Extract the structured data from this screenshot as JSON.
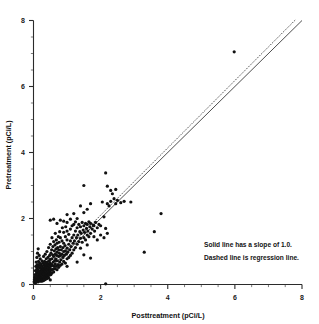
{
  "chart_data": {
    "type": "scatter",
    "title": "",
    "xlabel": "Posttreatment (pCi/L)",
    "ylabel": "Pretreatment (pCi/L)",
    "xlim": [
      0,
      8
    ],
    "ylim": [
      0,
      8
    ],
    "xticks": [
      0,
      2,
      4,
      6,
      8
    ],
    "yticks": [
      0,
      2,
      4,
      6,
      8
    ],
    "xtick_labels": [
      "0",
      "2",
      "4",
      "6",
      "8"
    ],
    "ytick_labels": [
      "0",
      "2",
      "4",
      "6",
      "8"
    ],
    "minor_tick_step": 0.5,
    "grid": false,
    "legend_position": "none",
    "annotations": [
      "Solid line has a slope of 1.0.",
      "Dashed line is regression line."
    ],
    "reference_lines": [
      {
        "name": "identity-line",
        "style": "solid",
        "slope": 1.0,
        "intercept": 0.0,
        "x_range": [
          0,
          8
        ]
      },
      {
        "name": "regression-line",
        "style": "dashed",
        "slope": 1.02,
        "intercept": 0.06,
        "x_range": [
          0,
          7.8
        ]
      }
    ],
    "marker": {
      "shape": "circle",
      "color": "#111111",
      "size_px": 2.3
    },
    "points": [
      [
        0.02,
        0.08
      ],
      [
        0.03,
        0.15
      ],
      [
        0.04,
        0.22
      ],
      [
        0.05,
        0.1
      ],
      [
        0.05,
        0.3
      ],
      [
        0.06,
        0.05
      ],
      [
        0.06,
        0.42
      ],
      [
        0.07,
        0.18
      ],
      [
        0.07,
        0.55
      ],
      [
        0.08,
        0.28
      ],
      [
        0.08,
        0.68
      ],
      [
        0.09,
        0.12
      ],
      [
        0.09,
        0.35
      ],
      [
        0.1,
        0.08
      ],
      [
        0.1,
        0.48
      ],
      [
        0.1,
        0.82
      ],
      [
        0.11,
        0.22
      ],
      [
        0.11,
        0.6
      ],
      [
        0.12,
        0.15
      ],
      [
        0.12,
        0.38
      ],
      [
        0.12,
        0.95
      ],
      [
        0.13,
        0.27
      ],
      [
        0.13,
        0.52
      ],
      [
        0.14,
        0.08
      ],
      [
        0.14,
        0.44
      ],
      [
        0.14,
        1.08
      ],
      [
        0.15,
        0.18
      ],
      [
        0.15,
        0.33
      ],
      [
        0.15,
        0.7
      ],
      [
        0.16,
        0.25
      ],
      [
        0.16,
        0.58
      ],
      [
        0.17,
        0.12
      ],
      [
        0.17,
        0.4
      ],
      [
        0.17,
        0.88
      ],
      [
        0.18,
        0.3
      ],
      [
        0.18,
        0.65
      ],
      [
        0.19,
        0.2
      ],
      [
        0.19,
        0.5
      ],
      [
        0.2,
        0.1
      ],
      [
        0.2,
        0.35
      ],
      [
        0.2,
        0.78
      ],
      [
        0.21,
        0.26
      ],
      [
        0.21,
        0.56
      ],
      [
        0.22,
        0.15
      ],
      [
        0.22,
        0.42
      ],
      [
        0.23,
        0.32
      ],
      [
        0.23,
        0.62
      ],
      [
        0.24,
        0.2
      ],
      [
        0.24,
        0.48
      ],
      [
        0.25,
        0.1
      ],
      [
        0.25,
        0.38
      ],
      [
        0.25,
        0.72
      ],
      [
        0.26,
        0.28
      ],
      [
        0.26,
        0.55
      ],
      [
        0.27,
        0.18
      ],
      [
        0.27,
        0.44
      ],
      [
        0.28,
        0.34
      ],
      [
        0.28,
        0.66
      ],
      [
        0.29,
        0.22
      ],
      [
        0.29,
        0.5
      ],
      [
        0.3,
        0.12
      ],
      [
        0.3,
        0.4
      ],
      [
        0.3,
        0.85
      ],
      [
        0.31,
        0.3
      ],
      [
        0.31,
        0.6
      ],
      [
        0.32,
        0.2
      ],
      [
        0.32,
        0.46
      ],
      [
        0.33,
        0.36
      ],
      [
        0.33,
        0.7
      ],
      [
        0.34,
        0.25
      ],
      [
        0.34,
        0.54
      ],
      [
        0.35,
        0.15
      ],
      [
        0.35,
        0.42
      ],
      [
        0.35,
        0.92
      ],
      [
        0.36,
        0.32
      ],
      [
        0.36,
        0.64
      ],
      [
        0.37,
        0.22
      ],
      [
        0.37,
        0.5
      ],
      [
        0.38,
        0.4
      ],
      [
        0.38,
        0.78
      ],
      [
        0.39,
        0.28
      ],
      [
        0.39,
        0.58
      ],
      [
        0.4,
        0.18
      ],
      [
        0.4,
        0.46
      ],
      [
        0.4,
        1.0
      ],
      [
        0.41,
        0.35
      ],
      [
        0.41,
        0.68
      ],
      [
        0.42,
        0.25
      ],
      [
        0.42,
        0.55
      ],
      [
        0.43,
        0.44
      ],
      [
        0.43,
        0.82
      ],
      [
        0.44,
        0.3
      ],
      [
        0.44,
        0.62
      ],
      [
        0.45,
        0.2
      ],
      [
        0.45,
        0.5
      ],
      [
        0.45,
        1.12
      ],
      [
        0.46,
        0.38
      ],
      [
        0.46,
        0.72
      ],
      [
        0.47,
        0.28
      ],
      [
        0.47,
        0.58
      ],
      [
        0.48,
        0.48
      ],
      [
        0.48,
        0.88
      ],
      [
        0.49,
        0.34
      ],
      [
        0.49,
        0.66
      ],
      [
        0.5,
        0.14
      ],
      [
        0.5,
        0.42
      ],
      [
        0.5,
        0.76
      ],
      [
        0.5,
        1.22
      ],
      [
        0.5,
        1.95
      ],
      [
        0.51,
        0.55
      ],
      [
        0.52,
        0.3
      ],
      [
        0.52,
        0.95
      ],
      [
        0.53,
        0.62
      ],
      [
        0.54,
        0.45
      ],
      [
        0.54,
        1.05
      ],
      [
        0.55,
        0.35
      ],
      [
        0.55,
        0.78
      ],
      [
        0.55,
        1.42
      ],
      [
        0.56,
        0.58
      ],
      [
        0.57,
        0.9
      ],
      [
        0.58,
        0.46
      ],
      [
        0.58,
        1.15
      ],
      [
        0.59,
        0.68
      ],
      [
        0.6,
        0.38
      ],
      [
        0.6,
        0.85
      ],
      [
        0.6,
        1.3
      ],
      [
        0.6,
        1.98
      ],
      [
        0.61,
        0.55
      ],
      [
        0.62,
        1.02
      ],
      [
        0.63,
        0.72
      ],
      [
        0.64,
        0.48
      ],
      [
        0.64,
        1.2
      ],
      [
        0.65,
        0.62
      ],
      [
        0.65,
        0.92
      ],
      [
        0.65,
        1.55
      ],
      [
        0.66,
        0.78
      ],
      [
        0.67,
        1.08
      ],
      [
        0.68,
        0.55
      ],
      [
        0.68,
        1.35
      ],
      [
        0.69,
        0.88
      ],
      [
        0.7,
        0.45
      ],
      [
        0.7,
        0.98
      ],
      [
        0.7,
        1.25
      ],
      [
        0.7,
        1.85
      ],
      [
        0.71,
        0.72
      ],
      [
        0.72,
        1.12
      ],
      [
        0.73,
        0.6
      ],
      [
        0.74,
        1.45
      ],
      [
        0.75,
        0.85
      ],
      [
        0.75,
        1.05
      ],
      [
        0.75,
        0.52
      ],
      [
        0.76,
        1.28
      ],
      [
        0.77,
        0.95
      ],
      [
        0.78,
        0.68
      ],
      [
        0.78,
        1.6
      ],
      [
        0.8,
        0.58
      ],
      [
        0.8,
        0.88
      ],
      [
        0.8,
        1.15
      ],
      [
        0.8,
        1.42
      ],
      [
        0.8,
        1.95
      ],
      [
        0.82,
        0.75
      ],
      [
        0.83,
        1.05
      ],
      [
        0.85,
        0.62
      ],
      [
        0.85,
        0.92
      ],
      [
        0.85,
        1.32
      ],
      [
        0.86,
        1.72
      ],
      [
        0.88,
        0.82
      ],
      [
        0.88,
        1.12
      ],
      [
        0.9,
        0.7
      ],
      [
        0.9,
        1.0
      ],
      [
        0.9,
        1.25
      ],
      [
        0.9,
        1.58
      ],
      [
        0.9,
        1.92
      ],
      [
        0.92,
        0.88
      ],
      [
        0.94,
        1.18
      ],
      [
        0.95,
        0.65
      ],
      [
        0.95,
        1.02
      ],
      [
        0.95,
        1.45
      ],
      [
        0.96,
        1.75
      ],
      [
        0.98,
        0.92
      ],
      [
        1.0,
        0.55
      ],
      [
        1.0,
        0.78
      ],
      [
        1.0,
        1.1
      ],
      [
        1.0,
        1.35
      ],
      [
        1.0,
        1.62
      ],
      [
        1.0,
        1.88
      ],
      [
        1.0,
        2.12
      ],
      [
        1.02,
        0.98
      ],
      [
        1.05,
        1.22
      ],
      [
        1.05,
        0.82
      ],
      [
        1.05,
        1.52
      ],
      [
        1.08,
        1.05
      ],
      [
        1.1,
        0.88
      ],
      [
        1.1,
        1.32
      ],
      [
        1.1,
        1.68
      ],
      [
        1.1,
        1.98
      ],
      [
        1.12,
        1.15
      ],
      [
        1.15,
        0.95
      ],
      [
        1.15,
        1.42
      ],
      [
        1.15,
        1.78
      ],
      [
        1.18,
        1.25
      ],
      [
        1.2,
        1.05
      ],
      [
        1.2,
        1.5
      ],
      [
        1.2,
        1.82
      ],
      [
        1.2,
        2.15
      ],
      [
        1.22,
        1.32
      ],
      [
        1.25,
        1.12
      ],
      [
        1.25,
        1.62
      ],
      [
        1.25,
        1.9
      ],
      [
        1.28,
        1.42
      ],
      [
        1.3,
        0.68
      ],
      [
        1.3,
        1.22
      ],
      [
        1.3,
        1.72
      ],
      [
        1.3,
        2.0
      ],
      [
        1.32,
        1.5
      ],
      [
        1.35,
        1.3
      ],
      [
        1.35,
        1.82
      ],
      [
        1.38,
        1.6
      ],
      [
        1.4,
        1.1
      ],
      [
        1.4,
        1.4
      ],
      [
        1.4,
        1.75
      ],
      [
        1.4,
        2.38
      ],
      [
        1.42,
        1.55
      ],
      [
        1.45,
        1.28
      ],
      [
        1.45,
        1.88
      ],
      [
        1.48,
        1.65
      ],
      [
        1.5,
        0.9
      ],
      [
        1.5,
        1.42
      ],
      [
        1.5,
        1.78
      ],
      [
        1.5,
        2.18
      ],
      [
        1.5,
        3.0
      ],
      [
        1.52,
        1.58
      ],
      [
        1.55,
        1.35
      ],
      [
        1.55,
        1.85
      ],
      [
        1.58,
        1.7
      ],
      [
        1.6,
        1.2
      ],
      [
        1.6,
        1.5
      ],
      [
        1.6,
        1.82
      ],
      [
        1.6,
        2.28
      ],
      [
        1.62,
        1.62
      ],
      [
        1.65,
        1.45
      ],
      [
        1.65,
        1.9
      ],
      [
        1.68,
        1.75
      ],
      [
        1.7,
        0.8
      ],
      [
        1.7,
        1.55
      ],
      [
        1.7,
        1.85
      ],
      [
        1.7,
        2.45
      ],
      [
        1.75,
        1.68
      ],
      [
        1.78,
        1.8
      ],
      [
        1.8,
        1.45
      ],
      [
        1.8,
        1.78
      ],
      [
        1.82,
        1.62
      ],
      [
        1.85,
        1.88
      ],
      [
        1.9,
        1.35
      ],
      [
        1.9,
        1.72
      ],
      [
        1.95,
        1.82
      ],
      [
        2.0,
        1.5
      ],
      [
        2.0,
        1.78
      ],
      [
        2.05,
        2.5
      ],
      [
        2.1,
        1.42
      ],
      [
        2.1,
        2.05
      ],
      [
        2.15,
        1.7
      ],
      [
        2.15,
        0.02
      ],
      [
        2.2,
        2.45
      ],
      [
        2.2,
        1.55
      ],
      [
        2.25,
        2.38
      ],
      [
        2.3,
        2.52
      ],
      [
        2.3,
        2.85
      ],
      [
        2.35,
        2.75
      ],
      [
        2.4,
        2.6
      ],
      [
        2.45,
        2.88
      ],
      [
        2.45,
        2.45
      ],
      [
        2.5,
        2.55
      ],
      [
        2.6,
        2.48
      ],
      [
        2.7,
        2.52
      ],
      [
        2.9,
        2.5
      ],
      [
        2.15,
        3.38
      ],
      [
        2.2,
        2.98
      ],
      [
        3.3,
        0.98
      ],
      [
        3.6,
        1.6
      ],
      [
        3.8,
        2.15
      ],
      [
        5.98,
        7.05
      ]
    ]
  },
  "axis": {
    "x_title": "Posttreatment (pCi/L)",
    "y_title": "Pretreatment (pCi/L)"
  }
}
